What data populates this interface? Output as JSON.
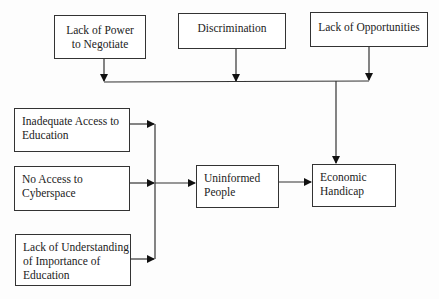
{
  "diagram": {
    "type": "flowchart",
    "nodes": [
      {
        "id": "lack_power",
        "label": "Lack of Power\nto Negotiate"
      },
      {
        "id": "discrimination",
        "label": "Discrimination"
      },
      {
        "id": "lack_opportunities",
        "label": "Lack of Opportunities"
      },
      {
        "id": "inadequate_access",
        "label": "Inadequate Access to\nEducation"
      },
      {
        "id": "no_cyberspace",
        "label": "No Access to\nCyberspace"
      },
      {
        "id": "lack_understanding",
        "label": "Lack of Understanding\nof Importance of\nEducation"
      },
      {
        "id": "uninformed",
        "label": "Uninformed\nPeople"
      },
      {
        "id": "economic_handicap",
        "label": "Economic\nHandicap"
      }
    ],
    "edges": [
      {
        "from": "lack_power",
        "to": "economic_handicap",
        "via": "top-bus"
      },
      {
        "from": "discrimination",
        "to": "economic_handicap",
        "via": "top-bus"
      },
      {
        "from": "lack_opportunities",
        "to": "economic_handicap",
        "via": "top-bus"
      },
      {
        "from": "inadequate_access",
        "to": "uninformed",
        "via": "left-bus"
      },
      {
        "from": "no_cyberspace",
        "to": "uninformed",
        "via": "left-bus"
      },
      {
        "from": "lack_understanding",
        "to": "uninformed",
        "via": "left-bus"
      },
      {
        "from": "uninformed",
        "to": "economic_handicap"
      }
    ]
  }
}
